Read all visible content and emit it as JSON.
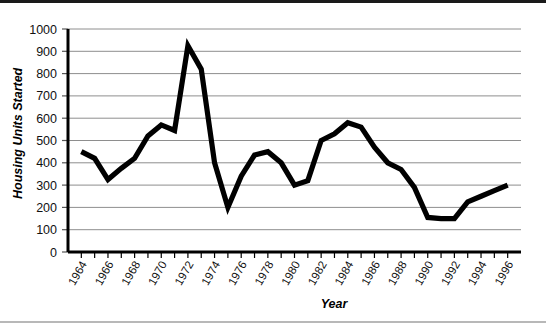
{
  "chart_data": {
    "type": "line",
    "title": "",
    "xlabel": "Year",
    "ylabel": "Housing Units Started",
    "xlim": [
      1963,
      1997
    ],
    "ylim": [
      0,
      1000
    ],
    "grid": true,
    "legend": false,
    "legend_position": "none",
    "y_ticks": [
      0,
      100,
      200,
      300,
      400,
      500,
      600,
      700,
      800,
      900,
      1000
    ],
    "y_tick_labels": [
      "0",
      "100",
      "200",
      "300",
      "400",
      "500",
      "600",
      "700",
      "800",
      "900",
      "1000"
    ],
    "x_ticks": [
      1964,
      1966,
      1968,
      1970,
      1972,
      1974,
      1976,
      1978,
      1980,
      1982,
      1984,
      1986,
      1988,
      1990,
      1992,
      1994,
      1996
    ],
    "x_tick_labels": [
      "1964",
      "1966",
      "1968",
      "1970",
      "1972",
      "1974",
      "1976",
      "1978",
      "1980",
      "1982",
      "1984",
      "1986",
      "1988",
      "1990",
      "1992",
      "1994",
      "1996"
    ],
    "series": [
      {
        "name": "Housing Units Started",
        "color": "#000000",
        "x": [
          1964,
          1965,
          1966,
          1967,
          1968,
          1969,
          1970,
          1971,
          1972,
          1973,
          1974,
          1975,
          1976,
          1977,
          1978,
          1979,
          1980,
          1981,
          1982,
          1983,
          1984,
          1985,
          1986,
          1987,
          1988,
          1989,
          1990,
          1991,
          1992,
          1993,
          1994,
          1995,
          1996
        ],
        "values": [
          450,
          420,
          325,
          375,
          420,
          520,
          570,
          545,
          925,
          820,
          400,
          200,
          340,
          435,
          450,
          400,
          300,
          320,
          500,
          530,
          580,
          560,
          470,
          400,
          370,
          290,
          155,
          150,
          150,
          225,
          250,
          275,
          300
        ]
      }
    ]
  },
  "axis_titles": {
    "y": "Housing Units Started",
    "x": "Year"
  }
}
